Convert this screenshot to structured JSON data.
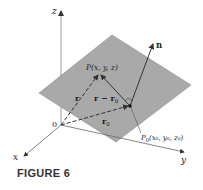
{
  "figure": {
    "caption": "FIGURE 6",
    "axes": {
      "x_label": "x",
      "y_label": "y",
      "z_label": "z",
      "origin_label": "0"
    },
    "vectors": {
      "r": "r",
      "r_minus_r0": "r − r",
      "r0": "r",
      "n": "n",
      "subscript_0": "0"
    },
    "points": {
      "P": "P(x, y, z)",
      "P0_main": "P",
      "P0_sub": "0",
      "P0_coords": "(x₀, y₀, z₀)"
    },
    "colors": {
      "plane": "#a9a9a9",
      "plane_edge": "#8e8e8e",
      "axis": "#555555",
      "text": "#222222"
    }
  }
}
